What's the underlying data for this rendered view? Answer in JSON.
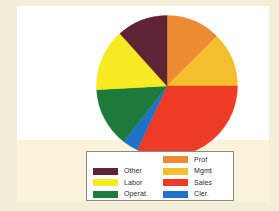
{
  "figure": {
    "background_color": "#f3eed7",
    "plate_color": "#ffffff",
    "band_color": "#faf3da"
  },
  "legend": {
    "border_color": "#8b8b86",
    "background_color": "#ffffff",
    "left_column": [
      {
        "label": "Other",
        "color": "#5e2434"
      },
      {
        "label": "Labor",
        "color": "#f7ea22"
      },
      {
        "label": "Operat.",
        "color": "#1d7a3a"
      }
    ],
    "right_column": [
      {
        "label": "Prof",
        "color": "#ee8a33"
      },
      {
        "label": "Mgmt",
        "color": "#f5be2e"
      },
      {
        "label": "Sales",
        "color": "#ee3b25"
      },
      {
        "label": "Cler.",
        "color": "#1f72c8"
      }
    ]
  },
  "chart_data": {
    "type": "pie",
    "title": "",
    "legend_position": "bottom",
    "start_angle_deg": 0,
    "direction": "clockwise",
    "labels": [
      "Prof",
      "Mgmt",
      "Sales",
      "Cler.",
      "Operat.",
      "Labor",
      "Other"
    ],
    "colors": [
      "#ee8a33",
      "#f5be2e",
      "#ee3b25",
      "#1f72c8",
      "#1d7a3a",
      "#f7ea22",
      "#5e2434"
    ],
    "angles_deg": [
      45,
      45,
      115,
      13,
      49,
      51,
      42
    ],
    "values": [
      12.5,
      12.5,
      31.9,
      3.6,
      13.6,
      14.2,
      11.7
    ],
    "slices": [
      {
        "label": "Prof",
        "color": "#ee8a33",
        "start_deg": 0,
        "end_deg": 45,
        "angle_deg": 45,
        "value": 12.5
      },
      {
        "label": "Mgmt",
        "color": "#f5be2e",
        "start_deg": 45,
        "end_deg": 90,
        "angle_deg": 45,
        "value": 12.5
      },
      {
        "label": "Sales",
        "color": "#ee3b25",
        "start_deg": 90,
        "end_deg": 205,
        "angle_deg": 115,
        "value": 31.9
      },
      {
        "label": "Cler.",
        "color": "#1f72c8",
        "start_deg": 205,
        "end_deg": 218,
        "angle_deg": 13,
        "value": 3.6
      },
      {
        "label": "Operat.",
        "color": "#1d7a3a",
        "start_deg": 218,
        "end_deg": 267,
        "angle_deg": 49,
        "value": 13.6
      },
      {
        "label": "Labor",
        "color": "#f7ea22",
        "start_deg": 267,
        "end_deg": 318,
        "angle_deg": 51,
        "value": 14.2
      },
      {
        "label": "Other",
        "color": "#5e2434",
        "start_deg": 318,
        "end_deg": 360,
        "angle_deg": 42,
        "value": 11.7
      }
    ]
  }
}
